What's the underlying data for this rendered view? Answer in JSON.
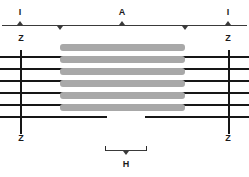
{
  "figure": {
    "type": "diagram"
  },
  "labels": {
    "band_i_left": "I",
    "band_a": "A",
    "band_i_right": "I",
    "z_top_left": "Z",
    "z_top_right": "Z",
    "z_bottom_left": "Z",
    "z_bottom_right": "Z",
    "zone_h": "H"
  },
  "colors": {
    "myosin": "#a8a8a8",
    "actin": "#171717",
    "zline": "#171717",
    "bracket": "#3a3a3a",
    "text": "#1a1a1a",
    "background": "#ffffff"
  },
  "geometry": {
    "width": 249,
    "height": 177,
    "z_left_x": 20,
    "z_right_x": 228,
    "a_band_start_x": 60,
    "a_band_end_x": 185,
    "h_zone_start_x": 105,
    "h_zone_end_x": 147,
    "bracket_y": 25,
    "h_bracket_y": 150
  },
  "myosin_filaments": [
    {
      "y": 44,
      "x": 60,
      "w": 125
    },
    {
      "y": 56,
      "x": 60,
      "w": 125
    },
    {
      "y": 68,
      "x": 60,
      "w": 125
    },
    {
      "y": 80,
      "x": 60,
      "w": 125
    },
    {
      "y": 92,
      "x": 60,
      "w": 125
    },
    {
      "y": 104,
      "x": 60,
      "w": 125
    }
  ],
  "actin_filaments": [
    {
      "y": 56,
      "left_x": 0,
      "left_w": 107,
      "right_x": 145,
      "right_w": 104
    },
    {
      "y": 68,
      "left_x": 0,
      "left_w": 107,
      "right_x": 145,
      "right_w": 104
    },
    {
      "y": 80,
      "left_x": 0,
      "left_w": 107,
      "right_x": 145,
      "right_w": 104
    },
    {
      "y": 92,
      "left_x": 0,
      "left_w": 107,
      "right_x": 145,
      "right_w": 104
    },
    {
      "y": 104,
      "left_x": 0,
      "left_w": 107,
      "right_x": 145,
      "right_w": 104
    },
    {
      "y": 116,
      "left_x": 0,
      "left_w": 107,
      "right_x": 145,
      "right_w": 104
    }
  ],
  "z_lines": [
    {
      "x": 20,
      "y": 50,
      "h": 84
    },
    {
      "x": 228,
      "y": 50,
      "h": 84
    }
  ],
  "bracket_ticks": {
    "up": [
      20,
      122,
      228
    ],
    "down": [
      60,
      185
    ]
  }
}
